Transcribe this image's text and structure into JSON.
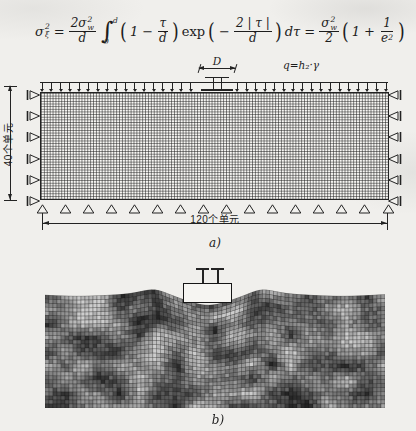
{
  "page": {
    "background": "#f0efec",
    "ink": "#232323"
  },
  "formula": {
    "sigma": "σ",
    "two": "2",
    "xi": "ξ",
    "w": "w",
    "equals": "=",
    "coef": "2σ",
    "d": "d",
    "integral": "∫",
    "zero": "0",
    "one": "1",
    "minus": "−",
    "tau": "τ",
    "exp_fn": "exp",
    "two_abs_tau": "2 | τ |",
    "dtau": "dτ",
    "plus": "+",
    "e": "e",
    "lparen": "(",
    "rparen": ")"
  },
  "figure_a": {
    "caption": "a)",
    "footing_dim_label": "D",
    "surcharge_label": "q=h₂·γ",
    "side_dim_label": "40个单元",
    "bottom_dim_label": "120个单元",
    "mesh_cols": 120,
    "mesh_rows": 40,
    "left_supports": 6,
    "right_supports": 6,
    "bottom_supports": 16,
    "load_arrows": 38
  },
  "figure_b": {
    "caption": "b)",
    "mesh_cols": 85,
    "mesh_rows": 28
  }
}
